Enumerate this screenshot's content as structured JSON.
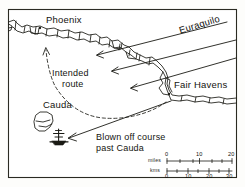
{
  "map": {
    "title_visible": false,
    "frame": {
      "stroke": "#2a2a22",
      "fill": "#ffffff"
    },
    "ink_color": "#1a1a14",
    "places": [
      {
        "name": "Phoenix",
        "label": "Phoenix",
        "x": 45,
        "y": 21,
        "dot_x": 40,
        "dot_y": 28,
        "type": "port"
      },
      {
        "name": "Fair Havens",
        "label": "Fair Havens",
        "x": 172,
        "y": 85,
        "dot_x": 169,
        "dot_y": 95,
        "type": "port"
      },
      {
        "name": "Cauda",
        "label": "Cauda",
        "x": 48,
        "y": 106,
        "dot_x": 0,
        "dot_y": 0,
        "type": "island"
      }
    ],
    "wind": {
      "label": "Euraquilo",
      "label_x": 188,
      "label_y": 20,
      "direction": "northeast-to-southwest",
      "arrow_count": 3
    },
    "routes": [
      {
        "id": "intended-route",
        "label_line1": "Intended",
        "label_line2": "route",
        "label_x": 55,
        "label_y": 74,
        "style": "dashed",
        "from": "Fair Havens",
        "to": "Phoenix"
      },
      {
        "id": "actual-route",
        "label_line1": "Blown off course",
        "label_line2": "past Cauda",
        "label_x": 110,
        "label_y": 135,
        "style": "solid",
        "from": "Fair Havens",
        "to": "Cauda"
      }
    ],
    "ship": {
      "name": "ship-symbol",
      "x": 59,
      "y": 137
    },
    "scale": {
      "miles": {
        "unit_label": "miles",
        "ticks": [
          "0",
          "10",
          "20"
        ],
        "minor_per_major": 5
      },
      "kms": {
        "unit_label": "kms",
        "ticks": [
          "0",
          "10",
          "20",
          "30"
        ],
        "minor_per_major": 5
      }
    }
  }
}
